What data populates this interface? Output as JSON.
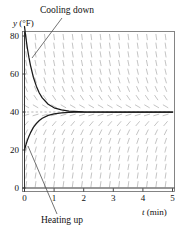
{
  "chart_data": {
    "type": "line",
    "title": "",
    "xlabel": "t (min)",
    "ylabel": "y (°F)",
    "xlim": [
      -0.1,
      5.15
    ],
    "ylim": [
      -4,
      86
    ],
    "xticks": [
      0,
      1,
      2,
      3,
      4,
      5
    ],
    "yticks": [
      0,
      20,
      40,
      60,
      80
    ],
    "xtick_labels": [
      "0",
      "1",
      "2",
      "3",
      "4",
      "5"
    ],
    "ytick_labels": [
      "0",
      "20",
      "40",
      "60",
      "80"
    ],
    "grid": false,
    "equilibrium": 40,
    "equilibrium_style": "dashed",
    "decay_rate": 3.0,
    "series": [
      {
        "name": "Cooling down",
        "style": "solid",
        "color": "#1a1a1a",
        "start": {
          "t": 0,
          "y": 85
        },
        "x": [
          0,
          0.05,
          0.1,
          0.15,
          0.2,
          0.3,
          0.4,
          0.5,
          0.6,
          0.8,
          1.0,
          1.25,
          1.5,
          2.0,
          2.5,
          3.0,
          4.0,
          5.0
        ],
        "y": [
          85,
          78.7,
          73.3,
          68.7,
          64.7,
          58.3,
          53.6,
          50.0,
          47.4,
          44.1,
          42.2,
          41.1,
          40.5,
          40.1,
          40.0,
          40.0,
          40.0,
          40.0
        ]
      },
      {
        "name": "Heating up",
        "style": "solid",
        "color": "#1a1a1a",
        "start": {
          "t": 0,
          "y": 20
        },
        "x": [
          0,
          0.05,
          0.1,
          0.15,
          0.2,
          0.3,
          0.4,
          0.5,
          0.6,
          0.8,
          1.0,
          1.25,
          1.5,
          2.0,
          2.5,
          3.0,
          4.0,
          5.0
        ],
        "y": [
          20,
          22.8,
          25.2,
          27.2,
          29.0,
          31.9,
          33.9,
          35.5,
          36.7,
          38.2,
          39.0,
          39.5,
          39.8,
          40.0,
          40.0,
          40.0,
          40.0,
          40.0
        ]
      }
    ],
    "direction_field": {
      "description": "slope marks for dy/dt = -k(y - 40)",
      "color": "#b9b9b9",
      "nx": 17,
      "ny": 19
    },
    "annotations": [
      {
        "name": "cooling-down-label",
        "text": "Cooling down",
        "leader_from": [
          62,
          18
        ],
        "leader_to": [
          32,
          58
        ]
      },
      {
        "name": "heating-up-label",
        "text": "Heating up",
        "leader_from": [
          28,
          146
        ],
        "leader_to": [
          57,
          214
        ]
      }
    ]
  },
  "labels": {
    "y_axis": {
      "var": "y",
      "unit": "(°F)"
    },
    "x_axis": {
      "var": "t",
      "unit": "(min)"
    },
    "cooling": "Cooling down",
    "heating": "Heating up"
  },
  "colors": {
    "curve": "#1a1a1a",
    "field": "#b9b9b9",
    "axis": "#333333",
    "frame": "#555555",
    "equilibrium": "#999999",
    "background": "#ffffff"
  }
}
